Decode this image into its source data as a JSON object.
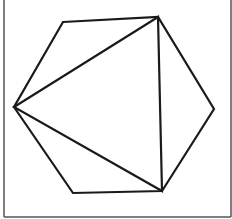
{
  "diagram": {
    "type": "geometry",
    "stroke_color": "#1a1a1a",
    "frame_color": "#555555",
    "hexagon_vertices": [
      [
        63,
        22
      ],
      [
        158,
        17
      ],
      [
        214,
        109
      ],
      [
        162,
        191
      ],
      [
        73,
        193
      ],
      [
        14,
        107
      ]
    ],
    "triangle_vertices": [
      [
        158,
        17
      ],
      [
        162,
        191
      ],
      [
        14,
        107
      ]
    ]
  }
}
